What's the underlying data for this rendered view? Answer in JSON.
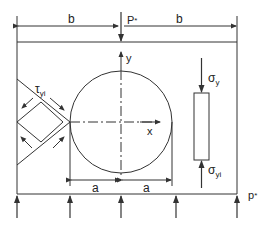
{
  "diagram": {
    "labels": {
      "b_left": "b",
      "b_right": "b",
      "P_top": "P",
      "P_top_sub": "*",
      "y_axis": "y",
      "x_axis": "x",
      "tau_main": "τ",
      "tau_sub": "yi",
      "sigma_y_main": "σ",
      "sigma_y_sub": "y",
      "sigma_yi_main": "σ",
      "sigma_yi_sub": "yi",
      "a_left": "a",
      "a_right": "a",
      "p_bottom": "p",
      "p_bottom_sub": "*"
    },
    "colors": {
      "line": "#333333",
      "text": "#222222",
      "background": "#ffffff"
    }
  }
}
